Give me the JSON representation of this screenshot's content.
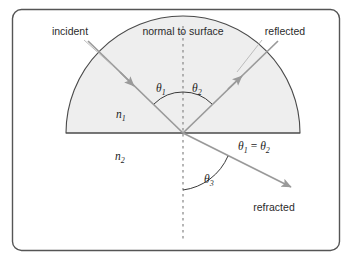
{
  "figure": {
    "title_visible": false,
    "labels": {
      "incident": "incident",
      "normal": "normal to surface",
      "reflected": "reflected",
      "refracted": "refracted",
      "n1": "n",
      "n1_sub": "1",
      "n2": "n",
      "n2_sub": "2",
      "theta1": "θ",
      "theta1_sub": "1",
      "theta2": "θ",
      "theta2_sub": "2",
      "theta3": "θ",
      "theta3_sub": "3",
      "equality_theta_a": "θ",
      "equality_theta_a_sub": "1",
      "equality_op": "=",
      "equality_theta_b": "θ",
      "equality_theta_b_sub": "2"
    },
    "colors": {
      "border": "#555555",
      "medium_fill": "#eeeeee",
      "medium_stroke": "#4a4a4a",
      "ray": "#9a9a9a",
      "normal_dash": "#8f8f8f",
      "arc": "#3a3a3a",
      "leader": "#b5b5b5",
      "text": "#2b2b2b",
      "background": "#ffffff"
    },
    "geometry": {
      "center_x": 183,
      "center_y": 133,
      "radius": 117,
      "normal_top_y": 26,
      "normal_bottom_y": 241
    }
  }
}
